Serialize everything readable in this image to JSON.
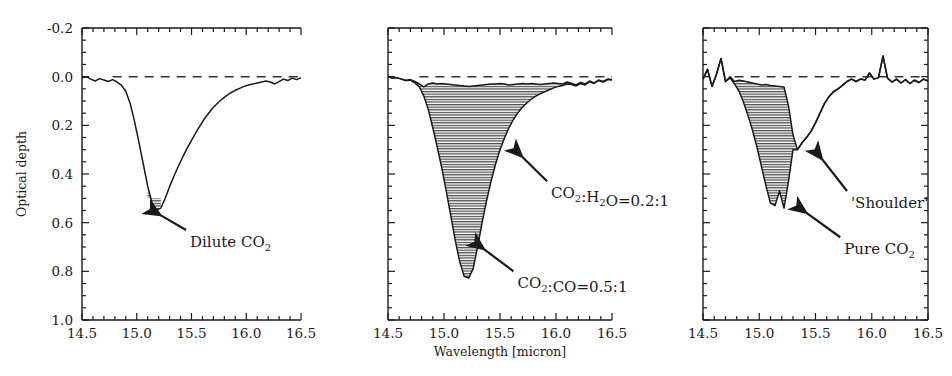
{
  "figure": {
    "axis_labels": {
      "y": "Optical depth",
      "x": "Wavelength [micron]"
    },
    "x_ticks": [
      "14.5",
      "15.0",
      "15.5",
      "16.0",
      "16.5"
    ],
    "y_ticks": [
      "-0.2",
      "0.0",
      "0.2",
      "0.4",
      "0.6",
      "0.8",
      "1.0"
    ],
    "colors": {
      "curve": "#1a1a1a",
      "hatch": "#555555",
      "baseline": "#333333",
      "frame": "#1a1a1a"
    }
  },
  "chart_data": [
    {
      "type": "line",
      "panel": 1,
      "title": "",
      "xlabel": "",
      "ylabel": "Optical depth",
      "xlim": [
        14.5,
        16.5
      ],
      "ylim": [
        1.0,
        -0.2
      ],
      "y_inverted": true,
      "grid": false,
      "baseline": 0.0,
      "annotations": [
        {
          "label": "Dilute CO2",
          "label_display": "Dilute CO",
          "sub": "2",
          "arrow_from_x": 15.45,
          "arrow_from_y": 0.63,
          "arrow_to_x": 15.22,
          "arrow_to_y": 0.57
        }
      ],
      "series": [
        {
          "name": "observed spectrum",
          "x": [
            14.5,
            14.54,
            14.58,
            14.62,
            14.66,
            14.7,
            14.74,
            14.78,
            14.82,
            14.86,
            14.9,
            14.94,
            14.98,
            15.02,
            15.06,
            15.1,
            15.14,
            15.18,
            15.22,
            15.26,
            15.3,
            15.34,
            15.38,
            15.42,
            15.46,
            15.5,
            15.54,
            15.58,
            15.62,
            15.66,
            15.7,
            15.74,
            15.78,
            15.82,
            15.86,
            15.9,
            15.94,
            15.98,
            16.02,
            16.06,
            16.1,
            16.14,
            16.18,
            16.22,
            16.26,
            16.3,
            16.34,
            16.38,
            16.42,
            16.46,
            16.5
          ],
          "y": [
            0.005,
            0.0,
            0.01,
            0.018,
            0.008,
            0.014,
            0.02,
            0.012,
            0.022,
            0.035,
            0.06,
            0.11,
            0.185,
            0.27,
            0.36,
            0.45,
            0.52,
            0.548,
            0.54,
            0.5,
            0.452,
            0.408,
            0.368,
            0.33,
            0.295,
            0.262,
            0.23,
            0.2,
            0.172,
            0.148,
            0.126,
            0.108,
            0.092,
            0.078,
            0.066,
            0.056,
            0.048,
            0.04,
            0.034,
            0.03,
            0.026,
            0.022,
            0.018,
            0.022,
            0.03,
            0.02,
            0.01,
            0.016,
            0.006,
            0.012,
            0.004
          ]
        }
      ],
      "fill_region": {
        "x_start": 15.1,
        "x_end": 15.24,
        "description": "small hatched wedge at minimum"
      }
    },
    {
      "type": "area",
      "panel": 2,
      "title": "",
      "xlabel": "Wavelength [micron]",
      "ylabel": "",
      "xlim": [
        14.5,
        16.5
      ],
      "ylim": [
        1.0,
        -0.2
      ],
      "y_inverted": true,
      "grid": false,
      "baseline": 0.0,
      "annotations": [
        {
          "label": "CO2:H2O=0.2:1",
          "arrow_from_x": 15.92,
          "arrow_from_y": 0.43,
          "arrow_to_x": 15.7,
          "arrow_to_y": 0.33
        },
        {
          "label": "CO2:CO=0.5:1",
          "arrow_from_x": 15.62,
          "arrow_from_y": 0.8,
          "arrow_to_x": 15.36,
          "arrow_to_y": 0.71
        }
      ],
      "series": [
        {
          "name": "upper envelope (CO2:H2O=0.2:1)",
          "x": [
            14.5,
            14.54,
            14.58,
            14.62,
            14.66,
            14.7,
            14.74,
            14.78,
            14.82,
            14.86,
            14.9,
            14.94,
            14.98,
            15.02,
            15.06,
            15.1,
            15.14,
            15.18,
            15.22,
            15.26,
            15.3,
            15.34,
            15.38,
            15.42,
            15.46,
            15.5,
            15.54,
            15.58,
            15.62,
            15.66,
            15.7,
            15.74,
            15.78,
            15.82,
            15.86,
            15.9,
            15.94,
            15.98,
            16.02,
            16.06,
            16.1,
            16.14,
            16.18,
            16.22,
            16.26,
            16.3,
            16.34,
            16.38,
            16.42,
            16.46,
            16.5
          ],
          "y": [
            0.0,
            0.006,
            0.004,
            0.01,
            0.016,
            0.012,
            0.02,
            0.03,
            0.042,
            0.03,
            0.026,
            0.03,
            0.028,
            0.03,
            0.032,
            0.034,
            0.036,
            0.038,
            0.04,
            0.038,
            0.036,
            0.034,
            0.032,
            0.03,
            0.03,
            0.028,
            0.03,
            0.034,
            0.032,
            0.03,
            0.028,
            0.03,
            0.028,
            0.03,
            0.032,
            0.03,
            0.028,
            0.026,
            0.028,
            0.03,
            0.022,
            0.028,
            0.034,
            0.024,
            0.03,
            0.018,
            0.026,
            0.014,
            0.02,
            0.01,
            0.012
          ]
        },
        {
          "name": "lower envelope (CO2:CO=0.5:1)",
          "x": [
            14.5,
            14.54,
            14.58,
            14.62,
            14.66,
            14.7,
            14.74,
            14.78,
            14.82,
            14.86,
            14.9,
            14.94,
            14.98,
            15.02,
            15.06,
            15.1,
            15.14,
            15.18,
            15.22,
            15.26,
            15.3,
            15.34,
            15.38,
            15.42,
            15.46,
            15.5,
            15.54,
            15.58,
            15.62,
            15.66,
            15.7,
            15.74,
            15.78,
            15.82,
            15.86,
            15.9,
            15.94,
            15.98,
            16.02,
            16.06,
            16.1,
            16.14,
            16.18,
            16.22,
            16.26,
            16.3,
            16.34,
            16.38,
            16.42,
            16.46,
            16.5
          ],
          "y": [
            0.0,
            0.006,
            0.004,
            0.01,
            0.016,
            0.014,
            0.026,
            0.042,
            0.08,
            0.135,
            0.21,
            0.29,
            0.375,
            0.47,
            0.57,
            0.672,
            0.76,
            0.82,
            0.828,
            0.79,
            0.7,
            0.6,
            0.51,
            0.43,
            0.36,
            0.3,
            0.252,
            0.21,
            0.176,
            0.148,
            0.126,
            0.108,
            0.092,
            0.08,
            0.07,
            0.062,
            0.054,
            0.046,
            0.04,
            0.036,
            0.03,
            0.032,
            0.038,
            0.028,
            0.034,
            0.02,
            0.028,
            0.016,
            0.022,
            0.012,
            0.014
          ]
        }
      ]
    },
    {
      "type": "area",
      "panel": 3,
      "title": "",
      "xlabel": "",
      "ylabel": "",
      "xlim": [
        14.5,
        16.5
      ],
      "ylim": [
        1.0,
        -0.2
      ],
      "y_inverted": true,
      "grid": false,
      "baseline": 0.0,
      "annotations": [
        {
          "label": "'Shoulder'",
          "arrow_from_x": 15.78,
          "arrow_from_y": 0.47,
          "arrow_to_x": 15.56,
          "arrow_to_y": 0.34
        },
        {
          "label": "Pure CO2",
          "arrow_from_x": 15.72,
          "arrow_from_y": 0.66,
          "arrow_to_x": 15.42,
          "arrow_to_y": 0.56
        }
      ],
      "series": [
        {
          "name": "upper envelope (noisy baseline / shoulder top)",
          "x": [
            14.5,
            14.54,
            14.58,
            14.62,
            14.66,
            14.7,
            14.74,
            14.78,
            14.82,
            14.86,
            14.9,
            14.94,
            14.98,
            15.02,
            15.06,
            15.1,
            15.14,
            15.18,
            15.22,
            15.26,
            15.3,
            15.34,
            15.38,
            15.42,
            15.46,
            15.5,
            15.54,
            15.58,
            15.62,
            15.66,
            15.7,
            15.74,
            15.78,
            15.82,
            15.86,
            15.9,
            15.94,
            15.98,
            16.02,
            16.06,
            16.1,
            16.14,
            16.18,
            16.22,
            16.26,
            16.3,
            16.34,
            16.38,
            16.42,
            16.46,
            16.5
          ],
          "y": [
            0.01,
            -0.03,
            0.04,
            -0.01,
            -0.075,
            0.02,
            0.0,
            0.02,
            0.015,
            0.018,
            0.022,
            0.026,
            0.03,
            0.034,
            0.032,
            0.036,
            0.038,
            0.04,
            0.042,
            0.12,
            0.24,
            0.3,
            0.272,
            0.25,
            0.225,
            0.19,
            0.15,
            0.11,
            0.082,
            0.062,
            0.05,
            0.036,
            0.02,
            0.01,
            0.02,
            0.01,
            0.014,
            -0.015,
            0.01,
            0.004,
            -0.085,
            0.006,
            0.022,
            0.01,
            0.026,
            0.012,
            0.028,
            0.014,
            0.024,
            0.01,
            0.018
          ]
        },
        {
          "name": "lower envelope (pure CO2 absorption)",
          "x": [
            14.5,
            14.54,
            14.58,
            14.62,
            14.66,
            14.7,
            14.74,
            14.78,
            14.82,
            14.86,
            14.9,
            14.94,
            14.98,
            15.02,
            15.06,
            15.1,
            15.14,
            15.18,
            15.22,
            15.26,
            15.3,
            15.34,
            15.38,
            15.42,
            15.46,
            15.5,
            15.54,
            15.58,
            15.62,
            15.66,
            15.7,
            15.74,
            15.78,
            15.82,
            15.86,
            15.9,
            15.94,
            15.98,
            16.02,
            16.06,
            16.1,
            16.14,
            16.18,
            16.22,
            16.26,
            16.3,
            16.34,
            16.38,
            16.42,
            16.46,
            16.5
          ],
          "y": [
            0.01,
            -0.03,
            0.04,
            -0.01,
            -0.075,
            0.02,
            0.005,
            0.03,
            0.06,
            0.105,
            0.16,
            0.22,
            0.29,
            0.37,
            0.45,
            0.52,
            0.53,
            0.47,
            0.54,
            0.43,
            0.3,
            0.3,
            0.272,
            0.25,
            0.225,
            0.19,
            0.15,
            0.11,
            0.082,
            0.062,
            0.05,
            0.036,
            0.02,
            0.01,
            0.02,
            0.01,
            0.014,
            -0.015,
            0.01,
            0.004,
            -0.085,
            0.006,
            0.022,
            0.01,
            0.026,
            0.012,
            0.028,
            0.014,
            0.024,
            0.01,
            0.018
          ]
        }
      ]
    }
  ]
}
